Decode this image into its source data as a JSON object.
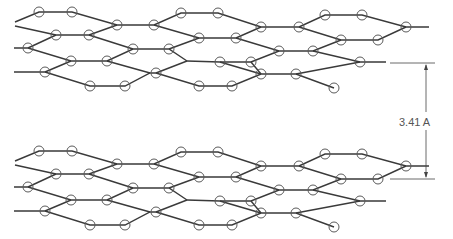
{
  "diagram": {
    "title": "",
    "interlayer_spacing_label": "3.41 A",
    "layers": 2,
    "colors": {
      "bond": "#3a3a3a",
      "atom_outline": "#5a5a5a",
      "dimension": "#444444",
      "label": "#555555"
    }
  }
}
